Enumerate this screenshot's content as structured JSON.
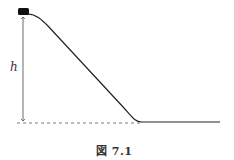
{
  "figure": {
    "caption": "図 7.1",
    "height_label": "h",
    "elements": {
      "block": "small black block at top of slope",
      "slope": "curved ramp descending to flat ground",
      "ground_reference": "dashed horizontal baseline",
      "height_arrow": "double-headed vertical arrow indicating height h"
    },
    "colors": {
      "line": "#222222",
      "block": "#111111",
      "dashed": "#555555"
    }
  }
}
